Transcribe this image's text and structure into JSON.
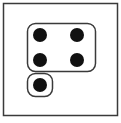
{
  "diagram": {
    "colors": {
      "stroke": "#3a3a3a",
      "dot": "#111111",
      "background": "#ffffff"
    },
    "frame": {
      "x": 3.5,
      "y": 3.5,
      "width": 114,
      "height": 112
    },
    "groups": [
      {
        "name": "group-of-four",
        "count": 4,
        "box": {
          "x": 27.5,
          "y": 23.5,
          "width": 68,
          "height": 48,
          "rx": 8
        },
        "dots": [
          {
            "cx": 40,
            "cy": 35,
            "r": 7
          },
          {
            "cx": 77,
            "cy": 35,
            "r": 7
          },
          {
            "cx": 40,
            "cy": 60,
            "r": 7
          },
          {
            "cx": 77,
            "cy": 60,
            "r": 7
          }
        ]
      },
      {
        "name": "group-of-one",
        "count": 1,
        "box": {
          "x": 27.5,
          "y": 73.5,
          "width": 25,
          "height": 23,
          "rx": 8
        },
        "dots": [
          {
            "cx": 40,
            "cy": 85,
            "r": 7
          }
        ]
      }
    ]
  }
}
